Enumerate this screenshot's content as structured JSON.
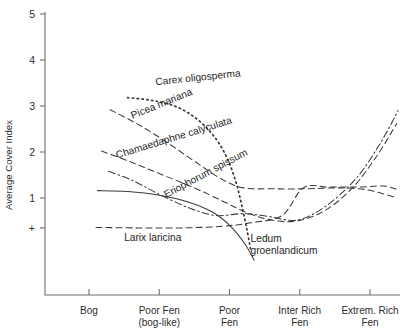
{
  "chart_data": {
    "type": "line",
    "title": "",
    "subtitle": "",
    "xlabel": "",
    "ylabel": "Average Cover Index",
    "grid": false,
    "legend_position": "inline-labels",
    "ylim": [
      0,
      5
    ],
    "y_ticks": [
      {
        "label": "+",
        "value": 0.35
      },
      {
        "label": "1",
        "value": 1
      },
      {
        "label": "2",
        "value": 2
      },
      {
        "label": "3",
        "value": 3
      },
      {
        "label": "4",
        "value": 4
      },
      {
        "label": "5",
        "value": 5
      }
    ],
    "x_categories": [
      {
        "label": "Bog",
        "label2": "",
        "index": 1
      },
      {
        "label": "Poor Fen",
        "label2": "(bog-like)",
        "index": 2
      },
      {
        "label": "Poor",
        "label2": "Fen",
        "index": 3
      },
      {
        "label": "Inter Rich",
        "label2": "Fen",
        "index": 4
      },
      {
        "label": "Extrem. Rich",
        "label2": "Fen",
        "index": 5
      }
    ],
    "xlim": [
      0.65,
      5.45
    ],
    "series": [
      {
        "name": "Carex oligosperma",
        "style": "dotted",
        "label_x": 1.95,
        "label_y": 3.45,
        "label_rotation": -6,
        "points": [
          {
            "x": 1.55,
            "y": 3.18
          },
          {
            "x": 1.9,
            "y": 3.12
          },
          {
            "x": 2.25,
            "y": 2.98
          },
          {
            "x": 2.55,
            "y": 2.7
          },
          {
            "x": 2.8,
            "y": 2.3
          },
          {
            "x": 2.98,
            "y": 1.82
          },
          {
            "x": 3.1,
            "y": 1.3
          },
          {
            "x": 3.18,
            "y": 0.8
          },
          {
            "x": 3.25,
            "y": 0.3
          },
          {
            "x": 3.3,
            "y": -0.12
          }
        ]
      },
      {
        "name": "Picea mariana",
        "style": "dashed",
        "label_x": 1.62,
        "label_y": 2.72,
        "label_rotation": -22,
        "points": [
          {
            "x": 1.3,
            "y": 2.92
          },
          {
            "x": 1.7,
            "y": 2.6
          },
          {
            "x": 2.1,
            "y": 2.22
          },
          {
            "x": 2.5,
            "y": 1.8
          },
          {
            "x": 2.9,
            "y": 1.4
          },
          {
            "x": 3.2,
            "y": 1.22
          },
          {
            "x": 3.6,
            "y": 1.2
          },
          {
            "x": 4.1,
            "y": 1.2
          },
          {
            "x": 4.55,
            "y": 1.22
          },
          {
            "x": 4.95,
            "y": 1.18
          },
          {
            "x": 5.35,
            "y": 1.02
          }
        ]
      },
      {
        "name": "Chamaedaphne calyculata",
        "style": "dashed",
        "label_x": 1.4,
        "label_y": 1.86,
        "label_rotation": -17,
        "points": [
          {
            "x": 1.18,
            "y": 2.02
          },
          {
            "x": 1.6,
            "y": 1.78
          },
          {
            "x": 2.05,
            "y": 1.5
          },
          {
            "x": 2.5,
            "y": 1.22
          },
          {
            "x": 2.92,
            "y": 0.92
          },
          {
            "x": 3.25,
            "y": 0.68
          },
          {
            "x": 3.6,
            "y": 0.52
          },
          {
            "x": 3.95,
            "y": 0.5
          },
          {
            "x": 4.35,
            "y": 0.72
          },
          {
            "x": 4.75,
            "y": 1.22
          },
          {
            "x": 5.1,
            "y": 1.92
          },
          {
            "x": 5.38,
            "y": 2.62
          }
        ]
      },
      {
        "name": "Eriophorum spissum",
        "style": "dashdot",
        "label_x": 2.1,
        "label_y": 1.0,
        "label_rotation": -28,
        "points": [
          {
            "x": 1.28,
            "y": 1.58
          },
          {
            "x": 1.62,
            "y": 1.38
          },
          {
            "x": 2.0,
            "y": 1.08
          },
          {
            "x": 2.4,
            "y": 0.8
          },
          {
            "x": 2.8,
            "y": 0.62
          },
          {
            "x": 3.2,
            "y": 0.66
          },
          {
            "x": 3.55,
            "y": 0.6
          },
          {
            "x": 3.95,
            "y": 0.52
          },
          {
            "x": 4.35,
            "y": 0.8
          },
          {
            "x": 4.8,
            "y": 1.42
          },
          {
            "x": 5.15,
            "y": 2.2
          },
          {
            "x": 5.4,
            "y": 2.9
          }
        ]
      },
      {
        "name": "Larix laricina",
        "style": "solid",
        "label_x": 1.5,
        "label_y": 0.06,
        "label_rotation": 0,
        "points": [
          {
            "x": 1.12,
            "y": 1.16
          },
          {
            "x": 1.55,
            "y": 1.14
          },
          {
            "x": 2.0,
            "y": 1.06
          },
          {
            "x": 2.4,
            "y": 0.92
          },
          {
            "x": 2.75,
            "y": 0.7
          },
          {
            "x": 3.02,
            "y": 0.38
          },
          {
            "x": 3.22,
            "y": 0.0
          },
          {
            "x": 3.35,
            "y": -0.35
          }
        ]
      },
      {
        "name": "Ledum groenlandicum",
        "name_line1": "Ledum",
        "name_line2": "groenlandicum",
        "style": "dashed",
        "label_x": 3.3,
        "label_y": 0.05,
        "label_rotation": 0,
        "points": [
          {
            "x": 1.1,
            "y": 0.36
          },
          {
            "x": 1.7,
            "y": 0.35
          },
          {
            "x": 2.3,
            "y": 0.35
          },
          {
            "x": 2.85,
            "y": 0.38
          },
          {
            "x": 3.3,
            "y": 0.46
          },
          {
            "x": 3.75,
            "y": 0.62
          },
          {
            "x": 4.05,
            "y": 1.22
          },
          {
            "x": 4.4,
            "y": 1.24
          },
          {
            "x": 4.85,
            "y": 1.24
          },
          {
            "x": 5.2,
            "y": 1.26
          },
          {
            "x": 5.4,
            "y": 1.18
          }
        ]
      }
    ]
  }
}
